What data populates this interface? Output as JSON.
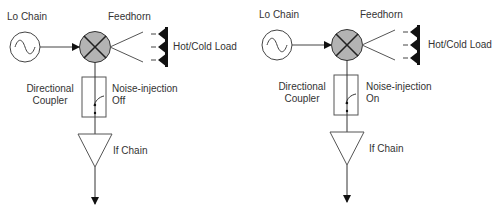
{
  "diagram": {
    "panels": [
      {
        "id": "left",
        "lo_chain_label": "Lo Chain",
        "feedhorn_label": "Feedhorn",
        "load_label": "Hot/Cold Load",
        "coupler_label_line1": "Directional",
        "coupler_label_line2": "Coupler",
        "noise_label_line1": "Noise-injection",
        "noise_label_line2": "Off",
        "if_label": "If Chain"
      },
      {
        "id": "right",
        "lo_chain_label": "Lo Chain",
        "feedhorn_label": "Feedhorn",
        "load_label": "Hot/Cold Load",
        "coupler_label_line1": "Directional",
        "coupler_label_line2": "Coupler",
        "noise_label_line1": "Noise-injection",
        "noise_label_line2": "On",
        "if_label": "If Chain"
      }
    ],
    "colors": {
      "stroke": "#333333",
      "mixer_fill": "#b3b3b3",
      "load_fill": "#111111"
    }
  }
}
